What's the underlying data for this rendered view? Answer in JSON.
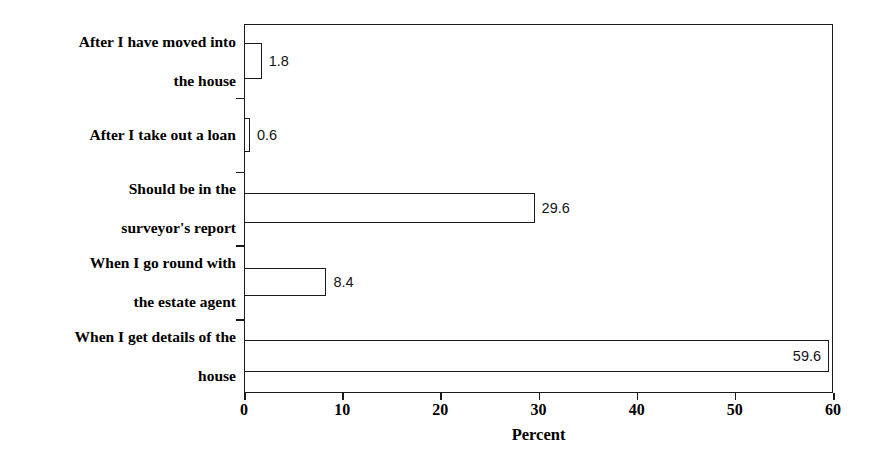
{
  "chart_data": {
    "type": "bar",
    "orientation": "horizontal",
    "title": "",
    "xlabel": "Percent",
    "ylabel": "",
    "xlim": [
      0,
      60
    ],
    "xticks": [
      0,
      10,
      20,
      30,
      40,
      50,
      60
    ],
    "xtick_labels": [
      "0",
      "10",
      "20",
      "30",
      "40",
      "50",
      "60"
    ],
    "grid": false,
    "legend": false,
    "categories": [
      "After I have moved into the house",
      "After I take out a loan",
      "Should be in the surveyor's report",
      "When I go round with the estate agent",
      "When I get details of the house"
    ],
    "values": [
      1.8,
      0.6,
      29.6,
      8.4,
      59.6
    ],
    "data_labels": [
      "1.8",
      "0.6",
      "29.6",
      "8.4",
      "59.6"
    ],
    "bars": [
      {
        "category": "After I have moved into the house",
        "category_line1": "After I have moved into",
        "category_line2": "the house",
        "value": 1.8,
        "label": "1.8",
        "label_position": "outside"
      },
      {
        "category": "After I take out a loan",
        "category_line1": "After I take out a loan",
        "category_line2": "",
        "value": 0.6,
        "label": "0.6",
        "label_position": "outside"
      },
      {
        "category": "Should be in the surveyor's report",
        "category_line1": "Should be in the",
        "category_line2": "surveyor's report",
        "value": 29.6,
        "label": "29.6",
        "label_position": "outside"
      },
      {
        "category": "When I go round with the estate agent",
        "category_line1": "When I go round with",
        "category_line2": "the estate agent",
        "value": 8.4,
        "label": "8.4",
        "label_position": "outside"
      },
      {
        "category": "When I get details of the house",
        "category_line1": "When I get details of the",
        "category_line2": "house",
        "value": 59.6,
        "label": "59.6",
        "label_position": "inside"
      }
    ],
    "colors": {
      "bar_fill": "#ffffff",
      "bar_edge": "#1a1a1a",
      "axis": "#1a1a1a",
      "text": "#000000",
      "background": "#ffffff"
    }
  }
}
